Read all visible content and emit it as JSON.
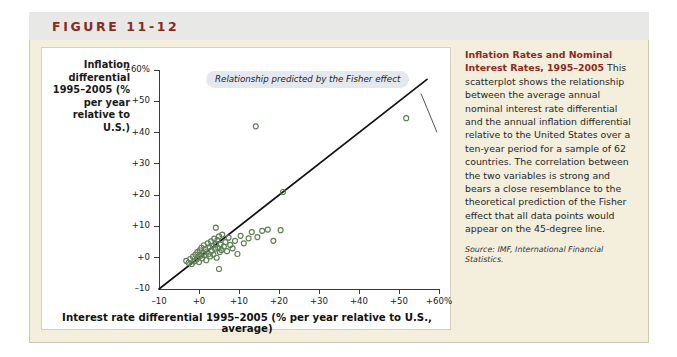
{
  "figure": {
    "number_label": "FIGURE 11-12"
  },
  "caption": {
    "heading": "Inflation Rates and Nominal Interest Rates, 1995–2005",
    "body": " This scatterplot shows the relationship between the average annual nominal interest rate differential and the annual inflation differential relative to the United States over a ten-year period for a sample of 62 countries. The correlation between the two variables is strong and bears a close resemblance to the theoretical prediction of the Fisher effect that all data points would appear on the 45-degree line.",
    "source": "Source: IMF, International Financial Statistics."
  },
  "chart_data": {
    "type": "scatter",
    "title": "",
    "ylabel": "Inflation differential 1995–2005 (% per year relative to U.S.)",
    "xlabel": "Interest rate differential 1995–2005 (% per year relative to U.S., average)",
    "xlim": [
      -10,
      60
    ],
    "ylim": [
      -10,
      60
    ],
    "grid": false,
    "legend": null,
    "xticks": [
      -10,
      0,
      10,
      20,
      30,
      40,
      50,
      60
    ],
    "xtick_labels": [
      "–10",
      "+0",
      "+10",
      "+20",
      "+30",
      "+40",
      "+50",
      "+60%"
    ],
    "yticks": [
      -10,
      0,
      10,
      20,
      30,
      40,
      50,
      60
    ],
    "ytick_labels": [
      "–10",
      "+0",
      "+10",
      "+20",
      "+30",
      "+40",
      "+50",
      "+60%"
    ],
    "annotations": [
      {
        "text": "Relationship predicted by the Fisher effect",
        "x": 22,
        "y": 55,
        "leader_to_x": 31,
        "leader_to_y": 42
      }
    ],
    "reference_line": {
      "name": "45-degree line",
      "from": [
        -10,
        -10
      ],
      "to": [
        57,
        57
      ],
      "color": "#121212"
    },
    "point_color": "#5f7f55",
    "series": [
      {
        "name": "Countries",
        "n_points": 62,
        "points": [
          [
            -3.2,
            -1.0
          ],
          [
            -2.6,
            -1.6
          ],
          [
            -2.2,
            -0.4
          ],
          [
            -1.8,
            -2.0
          ],
          [
            -1.5,
            0.3
          ],
          [
            -1.2,
            -1.2
          ],
          [
            -0.9,
            1.0
          ],
          [
            -0.6,
            -0.6
          ],
          [
            -0.4,
            1.8
          ],
          [
            -0.2,
            0.2
          ],
          [
            0.0,
            -1.4
          ],
          [
            0.2,
            2.4
          ],
          [
            0.4,
            0.6
          ],
          [
            0.6,
            3.2
          ],
          [
            0.8,
            -0.2
          ],
          [
            1.0,
            1.5
          ],
          [
            1.2,
            4.0
          ],
          [
            1.4,
            0.9
          ],
          [
            1.6,
            2.8
          ],
          [
            1.8,
            -0.8
          ],
          [
            2.0,
            2.0
          ],
          [
            2.2,
            4.6
          ],
          [
            2.4,
            1.2
          ],
          [
            2.6,
            3.4
          ],
          [
            2.8,
            0.4
          ],
          [
            3.0,
            5.2
          ],
          [
            3.2,
            2.2
          ],
          [
            3.4,
            3.9
          ],
          [
            3.6,
            1.0
          ],
          [
            3.8,
            6.1
          ],
          [
            4.0,
            2.9
          ],
          [
            4.2,
            4.4
          ],
          [
            4.4,
            0.0
          ],
          [
            4.6,
            5.6
          ],
          [
            4.8,
            3.1
          ],
          [
            5.0,
            6.8
          ],
          [
            5.2,
            1.8
          ],
          [
            5.4,
            4.2
          ],
          [
            5.6,
            2.5
          ],
          [
            5.8,
            7.4
          ],
          [
            6.2,
            3.6
          ],
          [
            6.6,
            5.0
          ],
          [
            7.0,
            2.1
          ],
          [
            7.4,
            6.4
          ],
          [
            7.8,
            4.1
          ],
          [
            8.4,
            3.0
          ],
          [
            9.0,
            5.4
          ],
          [
            9.6,
            1.2
          ],
          [
            4.2,
            9.6
          ],
          [
            5.0,
            -3.6
          ],
          [
            10.4,
            7.0
          ],
          [
            11.2,
            4.6
          ],
          [
            12.4,
            6.2
          ],
          [
            13.2,
            8.2
          ],
          [
            14.6,
            6.6
          ],
          [
            15.8,
            8.6
          ],
          [
            17.2,
            9.0
          ],
          [
            18.6,
            5.4
          ],
          [
            20.4,
            8.8
          ],
          [
            21.0,
            21.0
          ],
          [
            14.2,
            42.0
          ],
          [
            51.8,
            44.6
          ]
        ]
      }
    ]
  }
}
